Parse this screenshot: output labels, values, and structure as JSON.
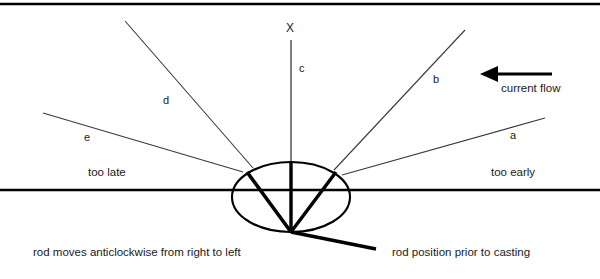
{
  "diagram": {
    "title_axis": "X",
    "rays": [
      {
        "id": "a",
        "label": "a"
      },
      {
        "id": "b",
        "label": "b"
      },
      {
        "id": "c",
        "label": "c"
      },
      {
        "id": "d",
        "label": "d"
      },
      {
        "id": "e",
        "label": "e"
      }
    ],
    "zones": {
      "left": "too late",
      "right": "too early"
    },
    "flow": {
      "label": "current flow",
      "direction": "left"
    },
    "captions": {
      "left": "rod moves anticlockwise from right to left",
      "right": "rod position prior to casting"
    },
    "colors": {
      "ink": "#000000",
      "thin_line": "#3a3a3a",
      "background": "#ffffff"
    }
  }
}
